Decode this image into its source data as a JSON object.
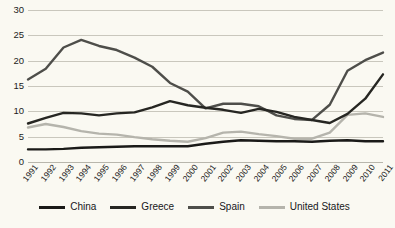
{
  "chart_data": {
    "type": "line",
    "title": "",
    "subtitle": "",
    "xlabel": "",
    "ylabel": "",
    "grid": true,
    "legend_position": "bottom",
    "xlim": [
      1991,
      2011
    ],
    "ylim": [
      0,
      30
    ],
    "y_ticks": [
      0,
      5,
      10,
      15,
      20,
      25,
      30
    ],
    "categories": [
      "1991",
      "1992",
      "1993",
      "1994",
      "1995",
      "1996",
      "1997",
      "1998",
      "1999",
      "2000",
      "2001",
      "2002",
      "2003",
      "2004",
      "2005",
      "2006",
      "2007",
      "2008",
      "2009",
      "2010",
      "2011"
    ],
    "series": [
      {
        "name": "China",
        "color": "#1a1a18",
        "values": [
          2.5,
          2.5,
          2.6,
          2.8,
          2.9,
          3.0,
          3.1,
          3.1,
          3.1,
          3.1,
          3.6,
          4.0,
          4.3,
          4.2,
          4.1,
          4.1,
          4.0,
          4.2,
          4.3,
          4.1,
          4.1
        ]
      },
      {
        "name": "Greece",
        "color": "#262622",
        "values": [
          7.6,
          8.7,
          9.7,
          9.6,
          9.2,
          9.6,
          9.8,
          10.8,
          12.0,
          11.2,
          10.7,
          10.3,
          9.7,
          10.5,
          9.9,
          8.9,
          8.3,
          7.7,
          9.5,
          12.5,
          17.3
        ]
      },
      {
        "name": "Spain",
        "color": "#4e4e4a",
        "values": [
          16.3,
          18.4,
          22.6,
          24.1,
          22.9,
          22.1,
          20.6,
          18.8,
          15.6,
          13.9,
          10.6,
          11.5,
          11.5,
          11.0,
          9.2,
          8.5,
          8.3,
          11.3,
          18.0,
          20.1,
          21.6
        ]
      },
      {
        "name": "United States",
        "color": "#b5b4ac",
        "values": [
          6.8,
          7.5,
          6.9,
          6.1,
          5.6,
          5.4,
          4.9,
          4.5,
          4.2,
          4.0,
          4.7,
          5.8,
          6.0,
          5.5,
          5.1,
          4.6,
          4.6,
          5.8,
          9.3,
          9.6,
          8.9
        ]
      }
    ]
  },
  "y_axis": {
    "ticks": [
      "0",
      "5",
      "10",
      "15",
      "20",
      "25",
      "30"
    ]
  },
  "x_axis": {
    "ticks": [
      "1991",
      "1992",
      "1993",
      "1994",
      "1995",
      "1996",
      "1997",
      "1998",
      "1999",
      "2000",
      "2001",
      "2002",
      "2003",
      "2004",
      "2005",
      "2006",
      "2007",
      "2008",
      "2009",
      "2010",
      "2011"
    ]
  },
  "legend": {
    "items": [
      {
        "label": "China",
        "color": "#1a1a18"
      },
      {
        "label": "Greece",
        "color": "#262622"
      },
      {
        "label": "Spain",
        "color": "#4e4e4a"
      },
      {
        "label": "United States",
        "color": "#b5b4ac"
      }
    ]
  },
  "colors": {
    "background": "#faf9f2",
    "gridline": "#c9c7bd",
    "text": "#1c1c1c"
  },
  "caption": {
    "text": ""
  }
}
